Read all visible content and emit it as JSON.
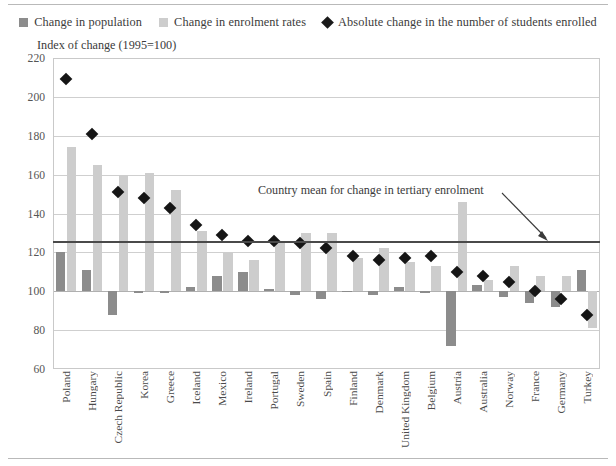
{
  "legend": {
    "items": [
      {
        "label": "Change in population",
        "icon": "square-swatch",
        "color": "#8c8c8c"
      },
      {
        "label": "Change in enrolment rates",
        "icon": "square-swatch",
        "color": "#cdcdcd"
      },
      {
        "label": "Absolute change in the number of students enrolled",
        "icon": "diamond-marker",
        "color": "#151515"
      }
    ]
  },
  "annotation": {
    "text": "Country mean for change in tertiary enrolment",
    "value": 126
  },
  "chart_data": {
    "type": "bar",
    "title": "",
    "subtitle": "",
    "ylabel": "Index of change (1995=100)",
    "xlabel": "",
    "ylim": [
      60,
      220
    ],
    "yticks": [
      60,
      80,
      100,
      120,
      140,
      160,
      180,
      200,
      220
    ],
    "grid": true,
    "baseline": 100,
    "legend_position": "top-center",
    "categories": [
      "Poland",
      "Hungary",
      "Czech Republic",
      "Korea",
      "Greece",
      "Iceland",
      "Mexico",
      "Ireland",
      "Portugal",
      "Sweden",
      "Spain",
      "Finland",
      "Denmark",
      "United Kingdom",
      "Belgium",
      "Austria",
      "Australia",
      "Norway",
      "France",
      "Germany",
      "Turkey"
    ],
    "series": [
      {
        "name": "Change in population",
        "type": "bar",
        "color": "#8c8c8c",
        "values": [
          120,
          111,
          88,
          99,
          99,
          102,
          108,
          110,
          101,
          98,
          96,
          100,
          98,
          102,
          99,
          72,
          103,
          97,
          94,
          92,
          111
        ]
      },
      {
        "name": "Change in enrolment rates",
        "type": "bar",
        "color": "#cdcdcd",
        "values": [
          174,
          165,
          160,
          161,
          152,
          131,
          120,
          116,
          126,
          130,
          130,
          117,
          122,
          115,
          113,
          146,
          106,
          113,
          108,
          108,
          81
        ]
      },
      {
        "name": "Absolute change in the number of students enrolled",
        "type": "scatter",
        "marker": "diamond",
        "color": "#151515",
        "values": [
          209,
          181,
          151,
          148,
          143,
          134,
          129,
          126,
          126,
          125,
          122,
          118,
          116,
          117,
          118,
          110,
          108,
          105,
          100,
          96,
          88
        ]
      }
    ]
  }
}
